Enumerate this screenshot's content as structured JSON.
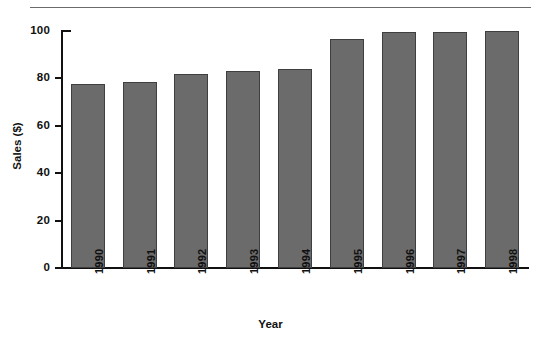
{
  "chart_data": {
    "type": "bar",
    "title": "",
    "xlabel": "Year",
    "ylabel": "Sales ($)",
    "categories": [
      "1990",
      "1991",
      "1992",
      "1993",
      "1994",
      "1995",
      "1996",
      "1997",
      "1998"
    ],
    "values": [
      77.5,
      78.5,
      82,
      83,
      84,
      96.5,
      99.5,
      99.5,
      100
    ],
    "ylim": [
      0,
      100
    ],
    "yticks": [
      "0",
      "20",
      "40",
      "60",
      "80",
      "100"
    ],
    "ytick_values": [
      0,
      20,
      40,
      60,
      80,
      100
    ],
    "grid": false,
    "legend": null,
    "bar_color": "#6b6b6b",
    "bar_edge_color": "#3f3f3f",
    "axis_color": "#111111",
    "background": "#ffffff"
  },
  "figure": {
    "top_rule_color": "#6a6a6a"
  }
}
